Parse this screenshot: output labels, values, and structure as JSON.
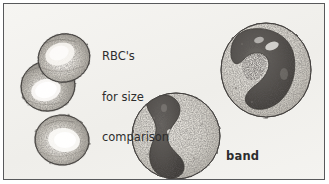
{
  "figure": {
    "kind": "biological-illustration",
    "style": "stippled pen-and-ink drawing",
    "frame_color": "#58595b",
    "background_color": "#f3f2ef",
    "text_color": "#2d2d2d"
  },
  "labels": {
    "rbc": {
      "line1": "RBC's",
      "line2": "for size",
      "line3": "comparison",
      "full": "RBC's for size comparison",
      "weight": "regular"
    },
    "band": {
      "line1": "band",
      "line2": "cells",
      "full": "band cells",
      "weight": "bold"
    }
  },
  "cells": [
    {
      "name": "rbc-upper",
      "type": "red-blood-cell",
      "cx": 60,
      "cy": 54,
      "rx": 26,
      "ry": 24,
      "rotation": -18,
      "fill": "#bdb9b2",
      "outline": "#4a4845",
      "pallor_color": "#f2f0ec",
      "description": "biconcave disc, stippled rim, pale central pallor"
    },
    {
      "name": "rbc-middle",
      "type": "red-blood-cell",
      "cx": 44,
      "cy": 82,
      "rx": 27,
      "ry": 25,
      "rotation": -12,
      "fill": "#b2aea7",
      "outline": "#4a4845",
      "pallor_color": "#f5f3ef",
      "description": "biconcave disc overlapping the upper RBC"
    },
    {
      "name": "rbc-lower",
      "type": "red-blood-cell",
      "cx": 58,
      "cy": 136,
      "rx": 27,
      "ry": 25,
      "rotation": 6,
      "fill": "#c2bfb8",
      "outline": "#4a4845",
      "pallor_color": "#f6f4f0",
      "description": "isolated biconcave disc below the pair"
    },
    {
      "name": "band-cell-center",
      "type": "band-cell",
      "cx": 172,
      "cy": 132,
      "rx": 44,
      "ry": 43,
      "cytoplasm_fill": "#d8d5ce",
      "outline": "#4a4845",
      "nucleus_fill": "#4f4c49",
      "nucleus_shape": "peanut-shaped band, sigmoid, unsegmented",
      "description": "neutrophilic band cell, horseshoe nucleus seen edge-on"
    },
    {
      "name": "band-cell-right",
      "type": "band-cell",
      "cx": 262,
      "cy": 66,
      "rx": 45,
      "ry": 47,
      "cytoplasm_fill": "#d8d5ce",
      "outline": "#4a4845",
      "nucleus_fill": "#4f4c49",
      "nucleus_shape": "curved C / S-shaped band, unsegmented",
      "description": "neutrophilic band cell with curved band nucleus"
    }
  ]
}
